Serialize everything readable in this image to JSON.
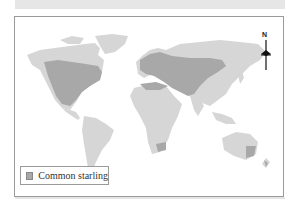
{
  "map": {
    "title": "",
    "north_label": "N",
    "colors": {
      "land": "#d6d6d6",
      "range": "#a8a8a8",
      "frame": "#9a9a9a",
      "band": "#e6e6e6"
    }
  },
  "legend": {
    "items": [
      {
        "label": "Common starling",
        "color": "#a8a8a8"
      }
    ]
  }
}
